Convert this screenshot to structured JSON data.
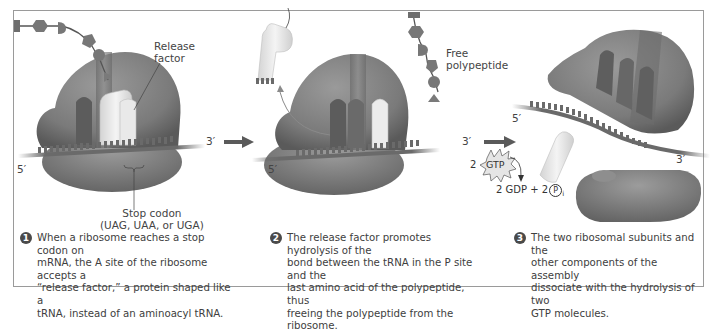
{
  "figure": {
    "colors": {
      "ribosome": "#7d7d7d",
      "ribosome_dark": "#5e5e5e",
      "release_factor": "#e6e6e6",
      "mrna": "#6a6a6a",
      "arrow": "#5a5a5a",
      "frame_border": "#9a9a9a",
      "step_badge": "#4a4a4a"
    },
    "labels": {
      "release_factor": "Release\nfactor",
      "stop_codon": "Stop codon\n(UAG, UAA, or UGA)",
      "free_polypeptide": "Free\npolypeptide",
      "five_prime": "5′",
      "three_prime": "3′",
      "gtp": "GTP",
      "gtp_count": "2",
      "gdp_products": "2 GDP + 2",
      "phosphate": "P",
      "phosphate_sub": "i"
    },
    "steps": [
      {
        "number": "1",
        "text": "When a ribosome reaches a stop codon on\nmRNA, the A site of the ribosome accepts a\n“release factor,” a protein shaped like a\ntRNA, instead of an aminoacyl tRNA."
      },
      {
        "number": "2",
        "text": "The release factor promotes hydrolysis of the\nbond between the tRNA in the P site and the\nlast amino acid of the polypeptide, thus\nfreeing the polypeptide from the ribosome."
      },
      {
        "number": "3",
        "text": "The two ribosomal subunits and the\nother components of the assembly\ndissociate with the hydrolysis of two\nGTP molecules."
      }
    ]
  }
}
